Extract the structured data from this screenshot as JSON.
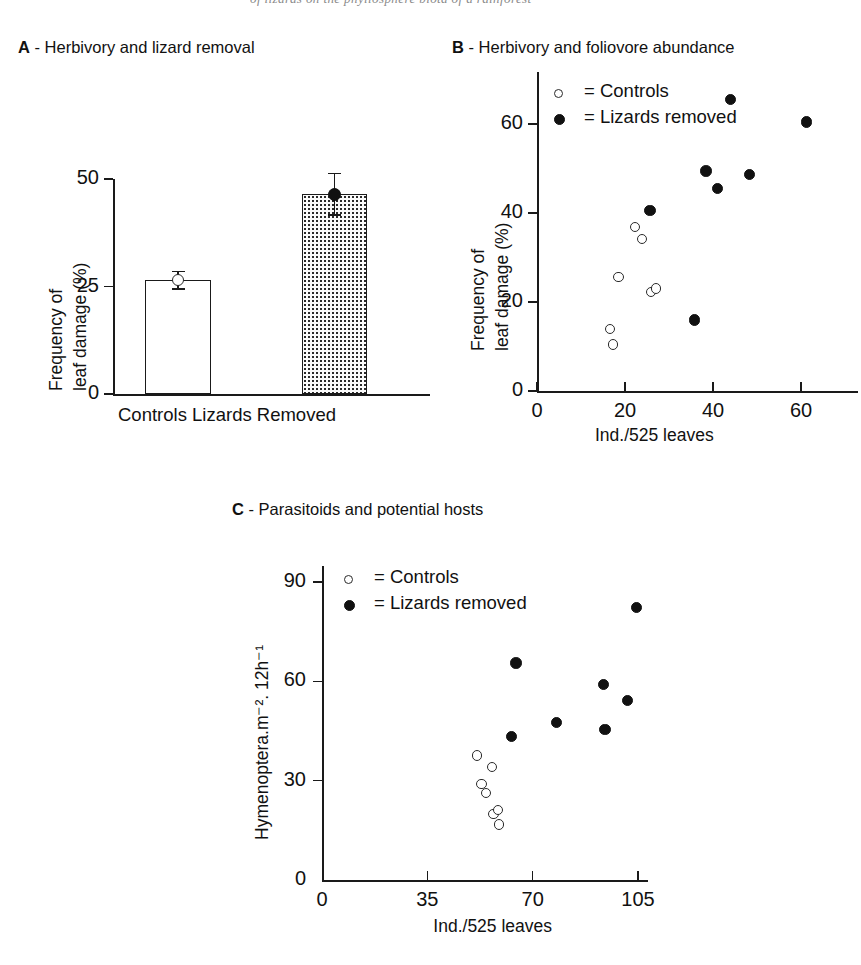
{
  "running_head": "of lizards on the phyllosphere biota of a rainforest",
  "panels": {
    "a": {
      "label": "A",
      "dash": "-",
      "title": "Herbivory and lizard removal",
      "y_axis_title_line1": "Frequency of",
      "y_axis_title_line2": "leaf damage (%)",
      "y_ticks": [
        "0",
        "25",
        "50"
      ],
      "category_label": "Controls Lizards Removed"
    },
    "b": {
      "label": "B",
      "dash": "-",
      "title": "Herbivory and foliovore abundance",
      "y_axis_title_line1": "Frequency of",
      "y_axis_title_line2": "leaf damage (%)",
      "y_ticks": [
        "0",
        "20",
        "40",
        "60"
      ],
      "x_ticks": [
        "0",
        "20",
        "40",
        "60"
      ],
      "x_axis_title": "Ind./525 leaves",
      "legend": [
        {
          "marker": "open-circle-marker",
          "text": "= Controls"
        },
        {
          "marker": "filled-circle-marker",
          "text": "= Lizards removed"
        }
      ]
    },
    "c": {
      "label": "C",
      "dash": "-",
      "title": "Parasitoids and potential hosts",
      "y_axis_title": "Hymenoptera.m⁻². 12h⁻¹",
      "y_ticks": [
        "0",
        "30",
        "60",
        "90"
      ],
      "x_ticks": [
        "0",
        "35",
        "70",
        "105"
      ],
      "x_axis_title": "Ind./525 leaves",
      "legend": [
        {
          "marker": "open-circle-marker",
          "text": "= Controls"
        },
        {
          "marker": "filled-circle-marker",
          "text": "= Lizards removed"
        }
      ]
    }
  },
  "chart_data": [
    {
      "panel": "A",
      "type": "bar",
      "title": "A - Herbivory and lizard removal",
      "xlabel": "Controls Lizards Removed",
      "ylabel": "Frequency of leaf damage (%)",
      "ylim": [
        0,
        50
      ],
      "yticks": [
        0,
        25,
        50
      ],
      "grid": false,
      "categories": [
        "Controls",
        "Lizards Removed"
      ],
      "values": [
        26.5,
        46.5
      ],
      "errors": [
        2.2,
        5.0
      ],
      "bar_styles": [
        "open",
        "dotted"
      ],
      "marker_styles": [
        "open-circle",
        "filled-circle"
      ]
    },
    {
      "panel": "B",
      "type": "scatter",
      "title": "B - Herbivory and foliovore abundance",
      "xlabel": "Ind./525 leaves",
      "ylabel": "Frequency of leaf damage (%)",
      "xlim": [
        0,
        68
      ],
      "ylim": [
        0,
        70
      ],
      "xticks": [
        0,
        20,
        40,
        60
      ],
      "yticks": [
        0,
        20,
        40,
        60
      ],
      "grid": false,
      "legend_position": "top-left",
      "series": [
        {
          "name": "Controls",
          "marker": "open-circle",
          "points": [
            [
              16.6,
              13.9
            ],
            [
              17.3,
              10.4
            ],
            [
              18.5,
              25.6
            ],
            [
              22.3,
              36.9
            ],
            [
              23.9,
              34.2
            ],
            [
              25.9,
              22.2
            ],
            [
              27.1,
              23.0
            ]
          ]
        },
        {
          "name": "Lizards removed",
          "marker": "filled-circle",
          "points": [
            [
              25.7,
              40.6
            ],
            [
              35.8,
              15.9
            ],
            [
              38.4,
              49.4
            ],
            [
              41.0,
              45.5
            ],
            [
              44.0,
              65.5
            ],
            [
              48.3,
              48.6
            ],
            [
              61.3,
              60.4
            ]
          ]
        }
      ]
    },
    {
      "panel": "C",
      "type": "scatter",
      "title": "C - Parasitoids and potential hosts",
      "xlabel": "Ind./525 leaves",
      "ylabel": "Hymenoptera.m⁻². 12h⁻¹",
      "xlim": [
        0,
        112
      ],
      "ylim": [
        0,
        90
      ],
      "xticks": [
        0,
        35,
        70,
        105
      ],
      "yticks": [
        0,
        30,
        60,
        90
      ],
      "grid": false,
      "legend_position": "top-left",
      "series": [
        {
          "name": "Controls",
          "marker": "open-circle",
          "points": [
            [
              51.5,
              37.6
            ],
            [
              53.0,
              29.0
            ],
            [
              54.5,
              26.3
            ],
            [
              56.5,
              34.2
            ],
            [
              57.0,
              19.9
            ],
            [
              58.5,
              21.2
            ],
            [
              58.8,
              16.8
            ]
          ]
        },
        {
          "name": "Lizards removed",
          "marker": "filled-circle",
          "points": [
            [
              63.0,
              43.3
            ],
            [
              64.5,
              65.5
            ],
            [
              78.0,
              47.6
            ],
            [
              93.5,
              59.0
            ],
            [
              94.0,
              45.5
            ],
            [
              101.5,
              54.2
            ],
            [
              104.5,
              82.3
            ]
          ]
        }
      ]
    }
  ]
}
